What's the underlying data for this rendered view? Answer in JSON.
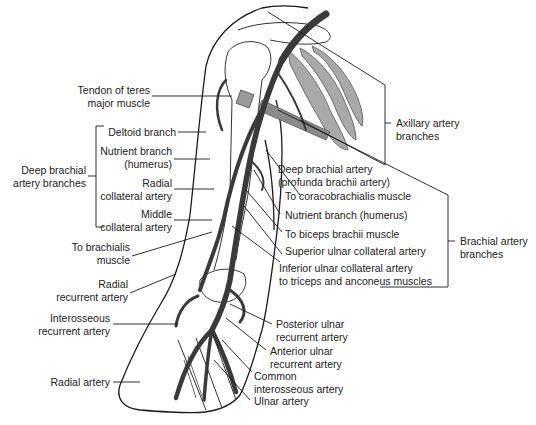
{
  "diagram": {
    "colors": {
      "artery": "#3a3a3a",
      "muscle": "#9a9a9a",
      "outline": "#1a1a1a",
      "leader": "#1a1a1a",
      "background": "#ffffff"
    },
    "labels": {
      "tendon_teres_major": "Tendon of teres\nmajor muscle",
      "deltoid_branch": "Deltoid branch",
      "nutrient_branch_humerus_left": "Nutrient branch\n(humerus)",
      "radial_collateral": "Radial\ncollateral artery",
      "middle_collateral": "Middle\ncollateral artery",
      "deep_brachial_group": "Deep brachial\nartery branches",
      "to_brachialis": "To brachialis\nmuscle",
      "radial_recurrent": "Radial\nrecurrent artery",
      "interosseous_recurrent": "Interosseous\nrecurrent artery",
      "radial_artery": "Radial artery",
      "axillary_group": "Axillary artery\nbranches",
      "deep_brachial": "Deep brachial artery\n(profunda brachii artery)",
      "to_coracobrachialis": "To coracobrachialis muscle",
      "nutrient_branch_humerus_right": "Nutrient branch (humerus)",
      "to_biceps": "To biceps brachii muscle",
      "superior_ulnar_collateral": "Superior ulnar collateral artery",
      "inferior_ulnar_collateral": "Inferior ulnar collateral artery\nto triceps and anconeus muscles",
      "brachial_group": "Brachial artery\nbranches",
      "posterior_ulnar_recurrent": "Posterior ulnar\nrecurrent artery",
      "anterior_ulnar_recurrent": "Anterior ulnar\nrecurrent artery",
      "common_interosseous": "Common\ninterosseous artery",
      "ulnar_artery": "Ulnar artery"
    }
  }
}
